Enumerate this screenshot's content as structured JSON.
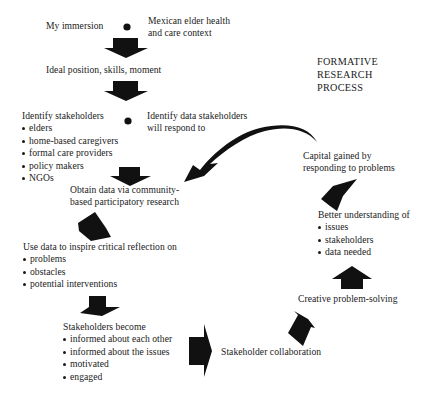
{
  "title": {
    "lines": [
      "FORMATIVE",
      "RESEARCH",
      "PROCESS"
    ]
  },
  "nodes": {
    "immersion": "My immersion",
    "context": {
      "lines": [
        "Mexican elder health",
        "and care context"
      ]
    },
    "ideal": "Ideal position, skills, moment",
    "identify_stakeholders": {
      "heading": "Identify stakeholders",
      "items": [
        "elders",
        "home-based caregivers",
        "formal care providers",
        "policy makers",
        "NGOs"
      ]
    },
    "identify_data": {
      "lines": [
        "Identify data stakeholders",
        "will respond to"
      ]
    },
    "obtain_data": {
      "lines": [
        "Obtain data via community-",
        "based participatory research"
      ]
    },
    "critical_reflection": {
      "heading": "Use data to inspire critical reflection on",
      "items": [
        "problems",
        "obstacles",
        "potential interventions"
      ]
    },
    "stakeholders_become": {
      "heading": "Stakeholders become",
      "items": [
        "informed about each other",
        "informed about the issues",
        "motivated",
        "engaged"
      ]
    },
    "collaboration": "Stakeholder collaboration",
    "problem_solving": "Creative problem-solving",
    "better_understanding": {
      "heading": "Better understanding of",
      "items": [
        "issues",
        "stakeholders",
        "data needed"
      ]
    },
    "capital": {
      "lines": [
        "Capital gained by",
        "responding to problems"
      ]
    }
  },
  "icons": {
    "plus_marker": "black-dot-plus",
    "arrow_fill": "#111111"
  }
}
